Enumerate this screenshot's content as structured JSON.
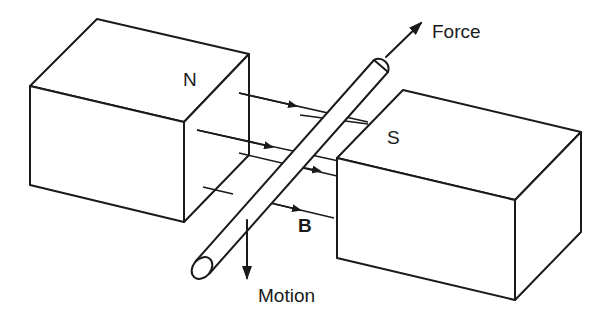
{
  "diagram": {
    "labels": {
      "north_pole": "N",
      "south_pole": "S",
      "force": "Force",
      "motion": "Motion",
      "field": "B"
    },
    "colors": {
      "line": "#1a1a1a",
      "background": "#ffffff"
    }
  }
}
